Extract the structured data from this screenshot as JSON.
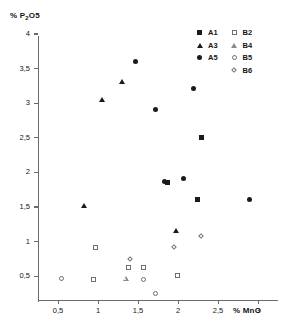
{
  "chart_data": {
    "type": "scatter",
    "title": "",
    "xlabel": "% MnO",
    "ylabel": "% P2O5",
    "ylabel_html": "% P₂O5",
    "xlim": [
      0.22,
      3.28
    ],
    "ylim": [
      0.22,
      4.06
    ],
    "xticks": [
      0.5,
      1,
      1.5,
      2,
      2.5,
      3
    ],
    "xtick_labels": [
      "0,5",
      "1",
      "1,5",
      "2",
      "2,5",
      "3"
    ],
    "yticks": [
      0.5,
      1,
      1.5,
      2,
      2.5,
      3,
      3.5,
      4
    ],
    "ytick_labels": [
      "0,5",
      "1",
      "1,5",
      "2",
      "2,5",
      "3",
      "3,5",
      "4"
    ],
    "grid": false,
    "legend_position": "top-right",
    "series": [
      {
        "name": "A1",
        "marker": "square-filled",
        "color": "#1a1a1a",
        "points": [
          {
            "x": 1.87,
            "y": 1.84
          },
          {
            "x": 2.3,
            "y": 2.5
          },
          {
            "x": 2.25,
            "y": 1.6
          }
        ]
      },
      {
        "name": "A3",
        "marker": "triangle-filled",
        "color": "#1a1a1a",
        "points": [
          {
            "x": 0.82,
            "y": 1.52
          },
          {
            "x": 1.05,
            "y": 3.04
          },
          {
            "x": 1.3,
            "y": 3.3
          },
          {
            "x": 1.97,
            "y": 1.15
          }
        ]
      },
      {
        "name": "A5",
        "marker": "circle-filled",
        "color": "#1a1a1a",
        "points": [
          {
            "x": 1.48,
            "y": 3.6
          },
          {
            "x": 1.72,
            "y": 2.9
          },
          {
            "x": 2.2,
            "y": 3.2
          },
          {
            "x": 1.84,
            "y": 1.86
          },
          {
            "x": 2.08,
            "y": 1.9
          },
          {
            "x": 2.9,
            "y": 1.6
          }
        ]
      },
      {
        "name": "B2",
        "marker": "square-open",
        "color": "#6e6e6e",
        "points": [
          {
            "x": 0.98,
            "y": 0.9
          },
          {
            "x": 0.95,
            "y": 0.44
          },
          {
            "x": 1.39,
            "y": 0.62
          },
          {
            "x": 1.58,
            "y": 0.62
          },
          {
            "x": 2.0,
            "y": 0.5
          }
        ]
      },
      {
        "name": "B4",
        "marker": "triangle-open",
        "color": "#8a8a8a",
        "points": [
          {
            "x": 1.35,
            "y": 0.46
          }
        ]
      },
      {
        "name": "B5",
        "marker": "circle-open",
        "color": "#6e6e6e",
        "points": [
          {
            "x": 0.55,
            "y": 0.46
          },
          {
            "x": 1.58,
            "y": 0.45
          },
          {
            "x": 1.73,
            "y": 0.24
          }
        ]
      },
      {
        "name": "B6",
        "marker": "diamond-open",
        "color": "#6e6e6e",
        "points": [
          {
            "x": 1.41,
            "y": 0.74
          },
          {
            "x": 1.96,
            "y": 0.9
          },
          {
            "x": 2.3,
            "y": 1.06
          }
        ]
      }
    ]
  },
  "legend": {
    "left_column": [
      {
        "label": "A1",
        "marker": "square-filled"
      },
      {
        "label": "A3",
        "marker": "triangle-filled"
      },
      {
        "label": "A5",
        "marker": "circle-filled"
      }
    ],
    "right_column": [
      {
        "label": "B2",
        "marker": "square-open"
      },
      {
        "label": "B4",
        "marker": "triangle-open"
      },
      {
        "label": "B5",
        "marker": "circle-open"
      },
      {
        "label": "B6",
        "marker": "diamond-open"
      }
    ]
  },
  "colors": {
    "filled": "#1a1a1a",
    "open_stroke": "#6e6e6e",
    "axis": "#6b6b6b",
    "background": "#ffffff"
  }
}
